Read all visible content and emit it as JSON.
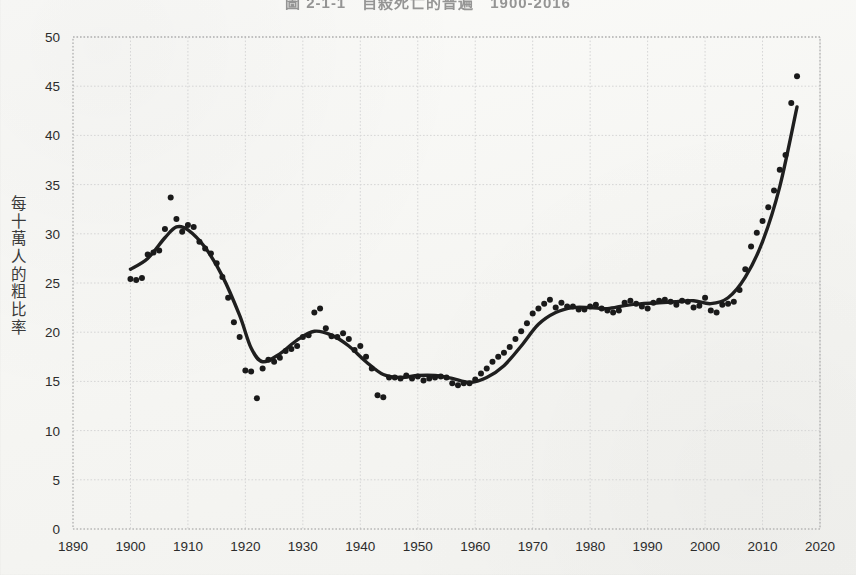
{
  "title": "圖 2-1-1　自殺死亡的普遍　1900-2016",
  "y_axis_title_chars": [
    "每",
    "十",
    "萬",
    "人",
    "的",
    "粗",
    "比",
    "率"
  ],
  "colors": {
    "line": "#1f1f1f",
    "point": "#1a1a1a",
    "grid": "#d6d6d6",
    "axis": "#9a9a9a",
    "paper": "#f7f7f5",
    "text": "#2b2b2b"
  },
  "chart_data": {
    "type": "scatter",
    "title": "圖 2-1-1　自殺死亡的普遍　1900-2016",
    "xlabel": "",
    "ylabel": "每十萬人的粗比率",
    "xlim": [
      1890,
      2020
    ],
    "ylim": [
      0,
      50
    ],
    "xticks": [
      1890,
      1900,
      1910,
      1920,
      1930,
      1940,
      1950,
      1960,
      1970,
      1980,
      1990,
      2000,
      2010,
      2020
    ],
    "yticks": [
      0,
      5,
      10,
      15,
      20,
      25,
      30,
      35,
      40,
      45,
      50
    ],
    "grid": true,
    "legend": "none",
    "series": [
      {
        "name": "粗比率 (觀測值)",
        "type": "scatter",
        "marker": "filled-circle",
        "x": [
          1900,
          1901,
          1902,
          1903,
          1904,
          1905,
          1906,
          1907,
          1908,
          1909,
          1910,
          1911,
          1912,
          1913,
          1914,
          1915,
          1916,
          1917,
          1918,
          1919,
          1920,
          1921,
          1922,
          1923,
          1924,
          1925,
          1926,
          1927,
          1928,
          1929,
          1930,
          1931,
          1932,
          1933,
          1934,
          1935,
          1936,
          1937,
          1938,
          1939,
          1940,
          1941,
          1942,
          1943,
          1944,
          1945,
          1946,
          1947,
          1948,
          1949,
          1950,
          1951,
          1952,
          1953,
          1954,
          1955,
          1956,
          1957,
          1958,
          1959,
          1960,
          1961,
          1962,
          1963,
          1964,
          1965,
          1966,
          1967,
          1968,
          1969,
          1970,
          1971,
          1972,
          1973,
          1974,
          1975,
          1976,
          1977,
          1978,
          1979,
          1980,
          1981,
          1982,
          1983,
          1984,
          1985,
          1986,
          1987,
          1988,
          1989,
          1990,
          1991,
          1992,
          1993,
          1994,
          1995,
          1996,
          1997,
          1998,
          1999,
          2000,
          2001,
          2002,
          2003,
          2004,
          2005,
          2006,
          2007,
          2008,
          2009,
          2010,
          2011,
          2012,
          2013,
          2014,
          2015,
          2016
        ],
        "y": [
          25.4,
          25.3,
          25.5,
          27.9,
          28.1,
          28.3,
          30.5,
          33.7,
          31.5,
          30.2,
          30.9,
          30.7,
          29.2,
          28.5,
          28.0,
          27.0,
          25.6,
          23.5,
          21.0,
          19.5,
          16.1,
          16.0,
          13.3,
          16.3,
          17.2,
          17.0,
          17.4,
          18.1,
          18.3,
          18.6,
          19.5,
          19.7,
          22.0,
          22.4,
          20.4,
          19.6,
          19.5,
          19.9,
          19.3,
          18.2,
          18.6,
          17.5,
          16.3,
          13.6,
          13.4,
          15.4,
          15.4,
          15.3,
          15.6,
          15.3,
          15.5,
          15.1,
          15.3,
          15.4,
          15.5,
          15.4,
          14.8,
          14.6,
          14.8,
          14.8,
          15.2,
          15.8,
          16.3,
          17.0,
          17.5,
          17.9,
          18.5,
          19.3,
          20.1,
          20.9,
          21.9,
          22.4,
          22.9,
          23.3,
          22.5,
          23.0,
          22.6,
          22.6,
          22.3,
          22.3,
          22.6,
          22.8,
          22.4,
          22.2,
          22.0,
          22.2,
          23.0,
          23.2,
          22.9,
          22.6,
          22.4,
          23.0,
          23.2,
          23.3,
          23.1,
          22.8,
          23.2,
          23.1,
          22.5,
          22.7,
          23.5,
          22.2,
          22.0,
          22.8,
          22.9,
          23.1,
          24.3,
          26.4,
          28.7,
          30.1,
          31.3,
          32.7,
          34.4,
          36.5,
          38.0,
          43.3,
          46.0
        ]
      },
      {
        "name": "平滑趨勢線",
        "type": "line",
        "x": [
          1900,
          1903,
          1906,
          1908,
          1910,
          1913,
          1916,
          1919,
          1921,
          1923,
          1926,
          1929,
          1932,
          1935,
          1938,
          1941,
          1944,
          1947,
          1950,
          1953,
          1956,
          1959,
          1962,
          1965,
          1968,
          1971,
          1974,
          1977,
          1980,
          1983,
          1986,
          1989,
          1992,
          1995,
          1998,
          2001,
          2004,
          2007,
          2010,
          2013,
          2016
        ],
        "y": [
          26.4,
          27.5,
          29.6,
          30.7,
          30.4,
          28.6,
          25.7,
          21.7,
          18.4,
          17.0,
          17.8,
          19.2,
          20.1,
          19.7,
          18.6,
          17.0,
          15.7,
          15.4,
          15.6,
          15.6,
          15.3,
          14.9,
          15.4,
          16.6,
          18.6,
          20.8,
          22.0,
          22.5,
          22.5,
          22.4,
          22.7,
          22.9,
          23.0,
          23.1,
          23.2,
          22.9,
          23.5,
          25.6,
          29.2,
          34.8,
          42.9
        ]
      }
    ]
  }
}
